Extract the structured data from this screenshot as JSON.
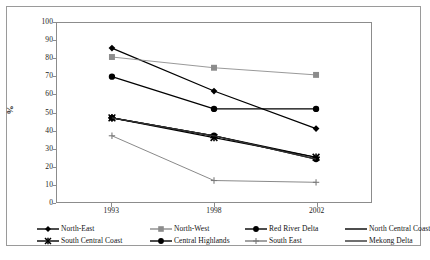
{
  "chart_data": {
    "type": "line",
    "title": "",
    "xlabel": "",
    "ylabel": "%",
    "x": [
      "1993",
      "1998",
      "2002"
    ],
    "categories": [
      "1993",
      "1998",
      "2002"
    ],
    "ylim": [
      0,
      100
    ],
    "yticks": [
      0,
      10,
      20,
      30,
      40,
      50,
      60,
      70,
      80,
      90,
      100
    ],
    "grid": false,
    "legend_position": "bottom",
    "series": [
      {
        "name": "North-East",
        "values": [
          86,
          62,
          41
        ],
        "marker": "diamond",
        "color": "#000000"
      },
      {
        "name": "North-West",
        "values": [
          81,
          75,
          71
        ],
        "marker": "square",
        "color": "#8c8c8c"
      },
      {
        "name": "Red River Delta",
        "values": [
          70,
          52,
          52
        ],
        "marker": "circle",
        "color": "#000000"
      },
      {
        "name": "North Central Coast",
        "values": [
          47,
          37,
          25
        ],
        "marker": "line",
        "color": "#000000"
      },
      {
        "name": "South Central Coast",
        "values": [
          47,
          36,
          25
        ],
        "marker": "star",
        "color": "#000000"
      },
      {
        "name": "Central Highlands",
        "values": [
          47,
          37,
          24
        ],
        "marker": "dot",
        "color": "#000000"
      },
      {
        "name": "South East",
        "values": [
          37,
          12,
          11
        ],
        "marker": "plus",
        "color": "#7a7a7a"
      },
      {
        "name": "Mekong Delta",
        "values": [
          47,
          37,
          24
        ],
        "marker": "none",
        "color": "#333333"
      }
    ]
  },
  "y_axis": {
    "title": "%",
    "ticks": [
      "100",
      "90",
      "80",
      "70",
      "60",
      "50",
      "40",
      "30",
      "20",
      "10",
      "0"
    ]
  },
  "x_axis": {
    "ticks": [
      "1993",
      "1998",
      "2002"
    ]
  },
  "legend": {
    "row1": [
      {
        "label": "North-East",
        "icon": "diamond-marker-icon"
      },
      {
        "label": "North-West",
        "icon": "square-marker-icon"
      },
      {
        "label": "Red River Delta",
        "icon": "circle-marker-icon"
      },
      {
        "label": "North Central Coast",
        "icon": "line-marker-icon"
      }
    ],
    "row2": [
      {
        "label": "South Central Coast",
        "icon": "star-marker-icon"
      },
      {
        "label": "Central Highlands",
        "icon": "dot-marker-icon"
      },
      {
        "label": "South East",
        "icon": "plus-marker-icon"
      },
      {
        "label": "Mekong Delta",
        "icon": "plain-line-marker-icon"
      }
    ]
  },
  "caption": ""
}
